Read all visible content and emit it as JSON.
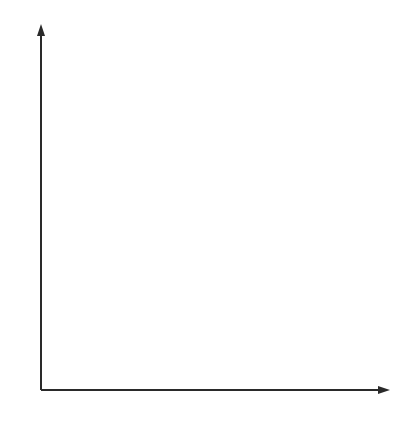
{
  "colors": {
    "grid": "#c4c4c4",
    "axis": "#2a2a2a",
    "curve": "#3a3a3a",
    "text": "#333333",
    "title": "#555555"
  },
  "chart_data": {
    "type": "line",
    "xlabel": "",
    "ylabel": "",
    "xlim": [
      0,
      4.2
    ],
    "ylim": [
      0,
      4.3
    ],
    "x_ticks": [
      "1",
      "2",
      "3",
      "4"
    ],
    "y_ticks": [
      "1",
      "2",
      "3",
      "4"
    ],
    "grid": true,
    "grid_minor_step": 0.25,
    "series": [
      {
        "name": "f",
        "function": "f(x) = 1/x",
        "x": [
          0.24,
          0.25,
          0.3,
          0.4,
          0.5,
          0.6,
          0.75,
          1,
          1.25,
          1.5,
          2,
          2.5,
          3,
          3.5,
          4,
          4.2
        ],
        "values": [
          4.17,
          4.0,
          3.33,
          2.5,
          2.0,
          1.67,
          1.33,
          1.0,
          0.8,
          0.67,
          0.5,
          0.4,
          0.33,
          0.29,
          0.25,
          0.24
        ]
      }
    ],
    "annotations": [
      {
        "text": "f",
        "x": 1.15,
        "y": 1.25
      }
    ]
  }
}
